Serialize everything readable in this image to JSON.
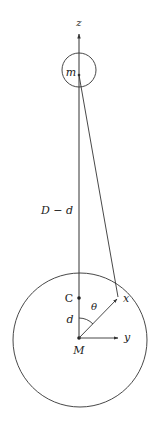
{
  "diagram": {
    "type": "physics-geometry",
    "labels": {
      "z_axis": "z",
      "y_axis": "y",
      "small_mass": "m",
      "large_mass": "M",
      "center_point": "C",
      "field_point": "x",
      "angle": "θ",
      "offset": "d",
      "distance": "D − d"
    },
    "colors": {
      "stroke": "#333333",
      "text": "#222222",
      "background": "#ffffff"
    },
    "geometry": {
      "z_axis": {
        "x": 79,
        "y_top": 33,
        "y_bottom": 338
      },
      "small_circle": {
        "cx": 79,
        "cy": 70,
        "r": 17
      },
      "large_circle": {
        "cx": 80,
        "cy": 340,
        "r": 67
      },
      "point_m": {
        "x": 79,
        "y": 75
      },
      "point_C": {
        "x": 79,
        "y": 298
      },
      "point_M": {
        "x": 79,
        "y": 338
      },
      "point_x": {
        "x": 118,
        "y": 298
      },
      "y_arrow_end": {
        "x": 118,
        "y": 338
      }
    }
  }
}
